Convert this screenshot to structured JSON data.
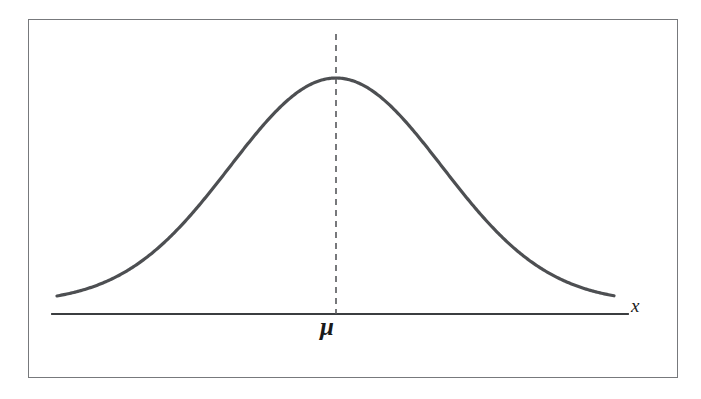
{
  "figure": {
    "kind": "normal-distribution-bell-curve",
    "frame": {
      "border_color": "#77797c",
      "background_color": "#ffffff",
      "x": 28,
      "y": 19,
      "width": 650,
      "height": 359
    },
    "curve": {
      "color": "#4d4f52",
      "stroke_width": 3.2,
      "x_start": 57,
      "x_end": 614,
      "peak_x": 336,
      "peak_y": 78,
      "baseline_y": 303,
      "sigma_px": 106
    },
    "axis": {
      "color": "#3b3d40",
      "stroke_width": 1.8,
      "y": 314,
      "x_start": 52,
      "x_end": 628
    },
    "mean_line": {
      "color": "#56585b",
      "stroke_width": 1.6,
      "x": 336,
      "y_top": 34,
      "y_bottom": 314,
      "dash": "6 5"
    }
  },
  "labels": {
    "mean_symbol": "μ",
    "x_axis_symbol": "x"
  },
  "chart_data": {
    "type": "line",
    "title": "",
    "subtitle": "",
    "xlabel": "x",
    "ylabel": "",
    "grid": false,
    "legend": null,
    "annotations": [
      {
        "text": "μ",
        "role": "mean-tick-label",
        "x_px": 336,
        "y_px": 328
      },
      {
        "text": "x",
        "role": "axis-name",
        "x_px": 637,
        "y_px": 307
      }
    ],
    "series": [
      {
        "name": "normal probability density",
        "distribution": "normal",
        "mean": 0,
        "std_dev": 1,
        "x": [
          -2.65,
          -2.4,
          -2.15,
          -1.9,
          -1.65,
          -1.4,
          -1.15,
          -0.9,
          -0.65,
          -0.4,
          -0.15,
          0.0,
          0.15,
          0.4,
          0.65,
          0.9,
          1.15,
          1.4,
          1.65,
          1.9,
          2.15,
          2.4,
          2.65
        ],
        "values": [
          0.0119,
          0.0224,
          0.0396,
          0.0656,
          0.1023,
          0.1497,
          0.2059,
          0.2661,
          0.323,
          0.3683,
          0.3945,
          0.3989,
          0.3945,
          0.3683,
          0.323,
          0.2661,
          0.2059,
          0.1497,
          0.1023,
          0.0656,
          0.0396,
          0.0224,
          0.0119
        ]
      }
    ],
    "xlim": [
      -2.65,
      2.65
    ],
    "ylim": [
      0,
      0.4
    ]
  }
}
